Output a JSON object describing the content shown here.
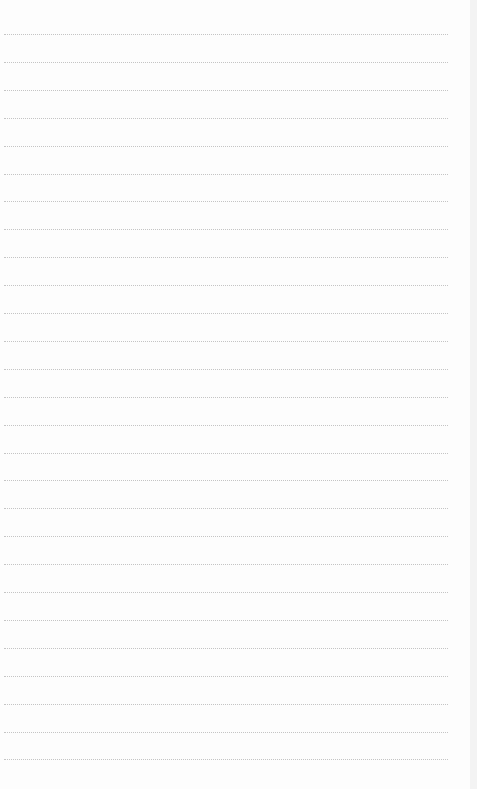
{
  "document": {
    "type": "lined-paper",
    "header_text": "",
    "line_count": 27,
    "first_line_y": 34,
    "line_spacing": 27.9,
    "line_color": "#c4c4c4",
    "background_color": "#fdfdfd",
    "lines": [
      "",
      "",
      "",
      "",
      "",
      "",
      "",
      "",
      "",
      "",
      "",
      "",
      "",
      "",
      "",
      "",
      "",
      "",
      "",
      "",
      "",
      "",
      "",
      "",
      "",
      "",
      ""
    ]
  }
}
